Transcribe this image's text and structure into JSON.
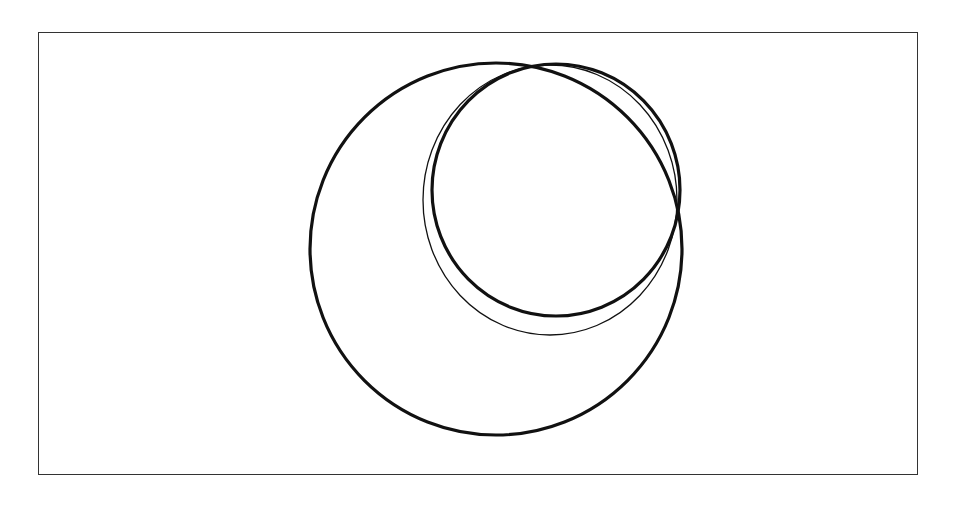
{
  "figure": {
    "type": "nested-circles-diagram",
    "frame": {
      "x": 38,
      "y": 32,
      "width": 880,
      "height": 443,
      "stroke": "#333333"
    },
    "circles": [
      {
        "name": "large-circle",
        "cx": 496,
        "cy": 249,
        "rx": 186,
        "ry": 186,
        "stroke": "#111111",
        "stroke_width": 3.2
      },
      {
        "name": "thin-circle",
        "cx": 550,
        "cy": 200,
        "rx": 127,
        "ry": 135,
        "stroke": "#111111",
        "stroke_width": 1.3
      },
      {
        "name": "medium-circle",
        "cx": 556,
        "cy": 190,
        "rx": 124,
        "ry": 126,
        "stroke": "#111111",
        "stroke_width": 3.2
      }
    ],
    "background_color": "#ffffff"
  }
}
